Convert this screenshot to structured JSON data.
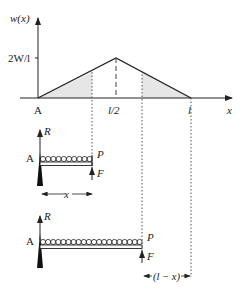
{
  "graph": {
    "y_label": "w(x)",
    "x_label": "x",
    "y_tick": "2W/l",
    "x_ticks": {
      "origin": "A",
      "mid": "l/2",
      "end": "l"
    },
    "shade_color": "#e6e6e6",
    "line_color": "#222222"
  },
  "beam_top": {
    "support_label": "A",
    "reaction_label": "R",
    "end_label": "P",
    "force_label": "F",
    "length_label": "x"
  },
  "beam_bottom": {
    "support_label": "A",
    "reaction_label": "R",
    "end_label": "P",
    "force_label": "F",
    "remaining_label": "(l − x)"
  }
}
